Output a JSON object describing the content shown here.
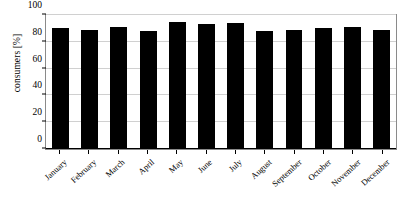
{
  "chart_data": {
    "type": "bar",
    "title": "",
    "xlabel": "",
    "ylabel": "consumers [%]",
    "ylim": [
      0,
      100
    ],
    "yticks": [
      0,
      20,
      40,
      60,
      80,
      100
    ],
    "grid": true,
    "legend": false,
    "bar_color": "#000000",
    "grid_color": "#d0d0d0",
    "frame_color": "#8a8a8a",
    "categories": [
      "January",
      "February",
      "March",
      "April",
      "May",
      "June",
      "July",
      "August",
      "September",
      "October",
      "November",
      "December"
    ],
    "values": [
      90,
      89,
      91,
      88,
      95,
      93,
      94,
      88,
      89,
      90,
      91,
      88.5
    ],
    "series": [
      {
        "name": "consumers",
        "values": [
          90,
          89,
          91,
          88,
          95,
          93,
          94,
          88,
          89,
          90,
          91,
          88.5
        ]
      }
    ]
  }
}
